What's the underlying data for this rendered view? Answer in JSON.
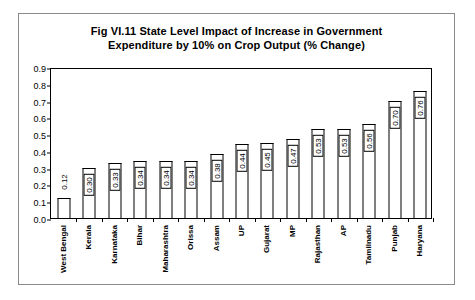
{
  "chart_data": {
    "type": "bar",
    "title": "Fig VI.11 State Level Impact of Increase in Government Expenditure by 10% on Crop Output (% Change)",
    "title_line1": "Fig VI.11 State Level Impact of Increase in Government",
    "title_line2": "Expenditure by 10% on Crop Output (% Change)",
    "xlabel": "",
    "ylabel": "",
    "ylim": [
      0,
      0.9
    ],
    "ytick_labels": [
      "0.0",
      "0.1",
      "0.2",
      "0.3",
      "0.4",
      "0.5",
      "0.6",
      "0.7",
      "0.8",
      "0.9"
    ],
    "ytick_values": [
      0,
      0.1,
      0.2,
      0.3,
      0.4,
      0.5,
      0.6,
      0.7,
      0.8,
      0.9
    ],
    "grid": false,
    "legend": false,
    "categories": [
      "West Bengal",
      "Kerala",
      "Karnataka",
      "Bihar",
      "Maharashtra",
      "Orissa",
      "Assam",
      "UP",
      "Gujarat",
      "MP",
      "Rajasthan",
      "AP",
      "Tamilnadu",
      "Punjab",
      "Haryana"
    ],
    "values": [
      0.12,
      0.3,
      0.33,
      0.34,
      0.34,
      0.34,
      0.38,
      0.44,
      0.45,
      0.47,
      0.53,
      0.53,
      0.56,
      0.7,
      0.76
    ],
    "value_labels": [
      "0.12",
      "0.30",
      "0.33",
      "0.34",
      "0.34",
      "0.34",
      "0.38",
      "0.44",
      "0.45",
      "0.47",
      "0.53",
      "0.53",
      "0.56",
      "0.70",
      "0.76"
    ],
    "bar_fill": "#ffffff",
    "bar_edge": "#000000",
    "background": "#ffffff"
  }
}
